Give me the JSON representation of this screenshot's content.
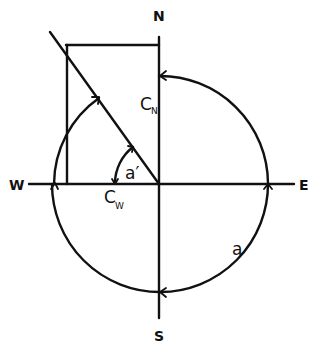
{
  "diagram": {
    "type": "compass-vector-decomposition",
    "colors": {
      "stroke": "#111111",
      "background": "#ffffff"
    },
    "compass_labels": {
      "north": "N",
      "south": "S",
      "east": "E",
      "west": "W"
    },
    "component_labels": {
      "north_main": "C",
      "north_sub": "N",
      "west_main": "C",
      "west_sub": "W"
    },
    "angle_labels": {
      "azimuth": "a",
      "complement": "a′"
    },
    "elements": [
      {
        "name": "circle",
        "description": "Circle centered at origin; full arc shown clockwise from N through E, S to W; upper-left arc drawn from W to diagonal"
      },
      {
        "name": "diagonal",
        "description": "Vector line from origin toward upper left (NW)"
      },
      {
        "name": "rectangle",
        "description": "Projection lines from diagonal endpoint to N axis and W axis"
      },
      {
        "name": "arrows",
        "description": "Arrowheads on circle at N, E, S, W crossings and at diagonal; angle arc a′ between W axis and diagonal"
      }
    ]
  }
}
